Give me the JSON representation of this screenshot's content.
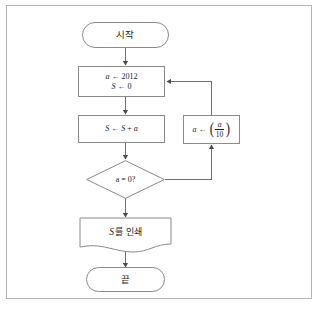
{
  "page": {
    "bg_color": "#ffffff",
    "frame_color": "#b4b4b4",
    "stroke_color": "#8a8a8a",
    "wire_color": "#6e6e6e",
    "text_color": "#1a1a1a"
  },
  "flowchart": {
    "type": "flowchart",
    "language": "ko",
    "nodes": [
      {
        "id": "start",
        "shape": "terminal",
        "label": "시작"
      },
      {
        "id": "init",
        "shape": "process",
        "line1_var": "a",
        "line1_arrow": "←",
        "line1_value": "2012",
        "line2_var": "S",
        "line2_arrow": "←",
        "line2_value": "0"
      },
      {
        "id": "accumulate",
        "shape": "process",
        "lhs": "S",
        "arrow": "←",
        "rhs_a": "S",
        "op": "+",
        "rhs_b": "a"
      },
      {
        "id": "decision",
        "shape": "diamond",
        "condition": "a = 0?"
      },
      {
        "id": "divide",
        "shape": "process",
        "lhs": "a",
        "arrow": "←",
        "bracket_open": "⎛",
        "numerator": "a",
        "denominator": "10",
        "bracket_close": "⎞"
      },
      {
        "id": "print",
        "shape": "document",
        "var": "S",
        "label_suffix": "를 인쇄"
      },
      {
        "id": "end",
        "shape": "terminal",
        "label": "끝"
      }
    ],
    "edges": [
      {
        "id": "e1",
        "from": "start",
        "to": "init",
        "label": ""
      },
      {
        "id": "e2",
        "from": "init",
        "to": "accumulate",
        "label": ""
      },
      {
        "id": "e3",
        "from": "accumulate",
        "to": "decision",
        "label": ""
      },
      {
        "id": "e4",
        "from": "decision",
        "to": "print",
        "label": ""
      },
      {
        "id": "e5",
        "from": "decision",
        "to": "divide",
        "label": ""
      },
      {
        "id": "e6",
        "from": "divide",
        "to": "init",
        "label": ""
      },
      {
        "id": "e7",
        "from": "print",
        "to": "end",
        "label": ""
      }
    ]
  }
}
